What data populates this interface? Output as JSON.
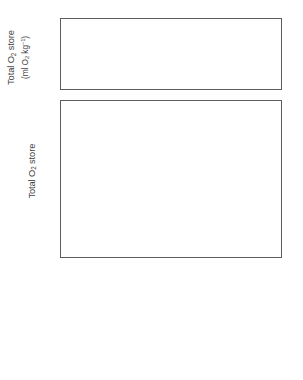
{
  "chart_data": [
    {
      "type": "bar",
      "panel": "top",
      "title": "",
      "xlabel": "",
      "ylabel": "Total O2 store (ml O2 kg-1)",
      "ylabel_line1": "Total O",
      "ylabel_line1_sub": "2",
      "ylabel_line1_rest": " store",
      "ylabel_line2_pre": "(ml O",
      "ylabel_line2_sub": "2",
      "ylabel_line2_mid": " kg",
      "ylabel_line2_sup": "−1",
      "ylabel_line2_post": ")",
      "categories": [
        "Leatherback turtle",
        "Loggerhead turtle",
        "Human",
        "Emporer penguin",
        "Sperm whale",
        "Weddell seal"
      ],
      "values": [
        27,
        22,
        20,
        68,
        75,
        90
      ],
      "ylim": [
        0,
        100
      ],
      "yticks": [
        0,
        20,
        40,
        60,
        80,
        100
      ],
      "ytick_labels": [
        "0",
        "20",
        "40",
        "60",
        "80",
        "100"
      ],
      "minor_ticks": true,
      "grid": false,
      "bar_color": "#c9c9c9",
      "bar_edge_color": "#555555"
    },
    {
      "type": "bar",
      "subtype": "stacked",
      "panel": "bottom",
      "title": "",
      "xlabel": "",
      "ylabel": "Total O2 store (%)",
      "ylabel_line1": "Total O",
      "ylabel_line1_sub": "2",
      "ylabel_line1_rest": " store",
      "ylabel_line2": "(%)",
      "categories": [
        "Leatherback turtle",
        "Loggerhead turtle",
        "Human",
        "Emporer penguin",
        "Sperm whale",
        "Weddell seal"
      ],
      "series": [
        {
          "name": "Muscle",
          "color": "#3d3d3d",
          "values": [
            6,
            4,
            27,
            37,
            34,
            32
          ]
        },
        {
          "name": "Blood",
          "color": "#8f8f8f",
          "values": [
            49,
            25,
            57,
            30,
            61,
            65
          ]
        },
        {
          "name": "Respiratory",
          "color": "#bfbfbf",
          "values": [
            45,
            71,
            16,
            33,
            5,
            3
          ]
        }
      ],
      "cumulative_tops": {
        "muscle": [
          6,
          4,
          27,
          37,
          34,
          32
        ],
        "blood": [
          55,
          29,
          84,
          67,
          95,
          97
        ],
        "respiratory": [
          100,
          100,
          100,
          100,
          100,
          100
        ]
      },
      "ylim": [
        0,
        100
      ],
      "yticks": [
        0,
        20,
        40,
        60,
        80,
        100
      ],
      "ytick_labels": [
        "0",
        "20",
        "40",
        "60",
        "80",
        "100"
      ],
      "minor_ticks": true,
      "grid": false,
      "legend_position": "bottom-right"
    }
  ],
  "legend": {
    "items": [
      {
        "label": "Respiratory",
        "color": "#bfbfbf"
      },
      {
        "label": "Blood",
        "color": "#8f8f8f"
      },
      {
        "label": "Muscle",
        "color": "#3d3d3d"
      }
    ]
  }
}
